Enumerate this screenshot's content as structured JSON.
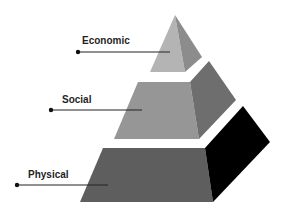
{
  "diagram": {
    "type": "pyramid",
    "tiers": [
      {
        "label": "Economic",
        "level": "top",
        "colors": {
          "front": "#b4b4b4",
          "side": "#8c8c8c"
        }
      },
      {
        "label": "Social",
        "level": "middle",
        "colors": {
          "front": "#969696",
          "side": "#6e6e6e"
        }
      },
      {
        "label": "Physical",
        "level": "bottom",
        "colors": {
          "front": "#5e5e5e",
          "side": "#000000"
        }
      }
    ],
    "leader_color": "#222222"
  }
}
